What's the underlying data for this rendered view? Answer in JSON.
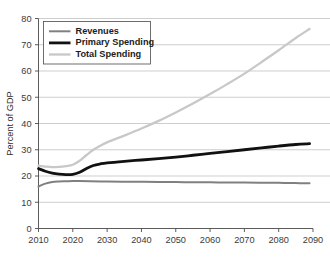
{
  "chart_data": {
    "type": "line",
    "title": "",
    "subtitle": "",
    "xlabel": "",
    "ylabel": "Percent of GDP",
    "xlim": [
      2010,
      2090
    ],
    "ylim": [
      0,
      80
    ],
    "grid": "horizontal",
    "legend_position": "top-left",
    "x_ticks": [
      "2010",
      "2020",
      "2030",
      "2040",
      "2050",
      "2060",
      "2070",
      "2080",
      "2090"
    ],
    "x_tick_values": [
      2010,
      2020,
      2030,
      2040,
      2050,
      2060,
      2070,
      2080,
      2090
    ],
    "y_ticks": [
      "0",
      "10",
      "20",
      "30",
      "40",
      "50",
      "60",
      "70",
      "80"
    ],
    "y_tick_values": [
      0,
      10,
      20,
      30,
      40,
      50,
      60,
      70,
      80
    ],
    "colors": {
      "revenues": "#808080",
      "primary_spending": "#111111",
      "total_spending": "#c8c8c8",
      "gridline": "#b9b9b9",
      "axis": "#4a4a4a",
      "background": "#ffffff"
    },
    "series": [
      {
        "name": "Revenues",
        "color": "#808080",
        "width": 2.0,
        "x": [
          2010,
          2012,
          2014,
          2016,
          2018,
          2020,
          2022,
          2025,
          2030,
          2035,
          2040,
          2045,
          2050,
          2055,
          2060,
          2065,
          2070,
          2075,
          2080,
          2085,
          2089
        ],
        "values": [
          16.0,
          17.1,
          17.7,
          17.9,
          18.0,
          18.1,
          18.1,
          18.0,
          17.9,
          17.8,
          17.8,
          17.7,
          17.7,
          17.6,
          17.6,
          17.5,
          17.5,
          17.4,
          17.4,
          17.3,
          17.2
        ]
      },
      {
        "name": "Primary Spending",
        "color": "#111111",
        "width": 2.8,
        "x": [
          2010,
          2012,
          2014,
          2016,
          2018,
          2020,
          2022,
          2024,
          2026,
          2028,
          2030,
          2035,
          2040,
          2045,
          2050,
          2055,
          2060,
          2065,
          2070,
          2075,
          2080,
          2085,
          2089
        ],
        "values": [
          22.8,
          21.8,
          21.1,
          20.7,
          20.5,
          20.6,
          21.4,
          22.9,
          24.0,
          24.6,
          25.0,
          25.6,
          26.1,
          26.6,
          27.2,
          27.9,
          28.6,
          29.3,
          30.0,
          30.7,
          31.4,
          32.0,
          32.3
        ]
      },
      {
        "name": "Total Spending",
        "color": "#c8c8c8",
        "width": 2.3,
        "x": [
          2010,
          2012,
          2014,
          2016,
          2018,
          2020,
          2022,
          2024,
          2026,
          2028,
          2030,
          2035,
          2040,
          2045,
          2050,
          2055,
          2060,
          2065,
          2070,
          2075,
          2080,
          2085,
          2089
        ],
        "values": [
          23.9,
          23.6,
          23.4,
          23.5,
          23.8,
          24.3,
          25.8,
          28.0,
          30.0,
          31.5,
          32.8,
          35.4,
          38.1,
          41.0,
          44.2,
          47.6,
          51.2,
          55.0,
          59.0,
          63.4,
          67.9,
          72.6,
          76.0
        ]
      }
    ]
  },
  "legend": {
    "items": [
      {
        "label": "Revenues"
      },
      {
        "label": "Primary Spending"
      },
      {
        "label": "Total Spending"
      }
    ]
  }
}
